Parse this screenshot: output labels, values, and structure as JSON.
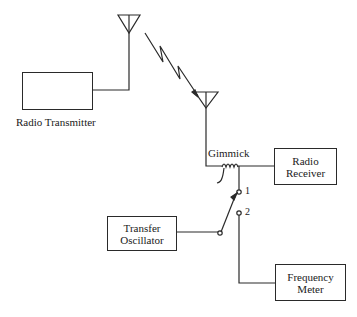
{
  "diagram": {
    "type": "block-diagram",
    "components": {
      "radio_transmitter": {
        "label": "Radio Transmitter"
      },
      "radio_receiver": {
        "line1": "Radio",
        "line2": "Receiver"
      },
      "transfer_oscillator": {
        "line1": "Transfer",
        "line2": "Oscillator"
      },
      "frequency_meter": {
        "line1": "Frequency",
        "line2": "Meter"
      },
      "gimmick": {
        "label": "Gimmick"
      }
    },
    "switch": {
      "position_1": "1",
      "position_2": "2"
    },
    "connections": [
      {
        "from": "Radio Transmitter",
        "to": "Transmit Antenna"
      },
      {
        "from": "Transmit Antenna",
        "to": "Receive Antenna",
        "kind": "radio link"
      },
      {
        "from": "Receive Antenna",
        "to": "Radio Receiver",
        "via": "Gimmick"
      },
      {
        "from": "Gimmick",
        "to": "Switch position 1"
      },
      {
        "from": "Transfer Oscillator",
        "to": "Switch"
      },
      {
        "from": "Switch position 2",
        "to": "Frequency Meter"
      }
    ]
  }
}
